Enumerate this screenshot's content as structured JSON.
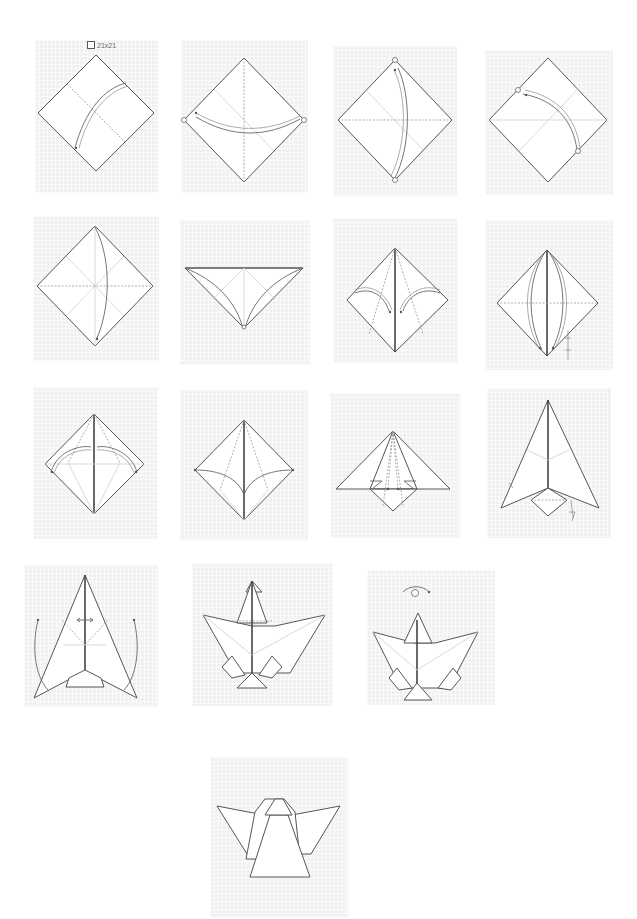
{
  "diagram": {
    "type": "origami-instructions",
    "paper_size_label": "21x21",
    "background": "#ffffff",
    "panel_background": "#f1f1f1",
    "line_color": "#555555",
    "steps": [
      {
        "step": 1,
        "row": 1,
        "description": "Square paper, diagonal valley crease, fold corner to corner",
        "symbols": [
          "paper-size",
          "valley-fold-arrow"
        ]
      },
      {
        "step": 2,
        "row": 1,
        "description": "Fold left corner to right corner along vertical diagonal",
        "symbols": [
          "valley-fold-arrow",
          "corner-markers"
        ]
      },
      {
        "step": 3,
        "row": 1,
        "description": "Fold top corner to bottom corner",
        "symbols": [
          "valley-fold-arrow",
          "corner-markers"
        ]
      },
      {
        "step": 4,
        "row": 1,
        "description": "Fold lower-right edge point to upper-left edge point",
        "symbols": [
          "valley-fold-arrow",
          "corner-markers"
        ]
      },
      {
        "step": 5,
        "row": 2,
        "description": "Fold top corner down to bottom corner",
        "symbols": [
          "valley-fold-arrow"
        ]
      },
      {
        "step": 6,
        "row": 2,
        "description": "Triangle with curved fold lines meeting at bottom point",
        "symbols": [
          "valley-fold-arrow"
        ]
      },
      {
        "step": 7,
        "row": 2,
        "description": "Fold side corners in to center line",
        "symbols": [
          "valley-fold-arrow"
        ]
      },
      {
        "step": 8,
        "row": 2,
        "description": "Fold edges to center, then unfold",
        "symbols": [
          "valley-fold-arrow",
          "fold-unfold"
        ]
      },
      {
        "step": 9,
        "row": 3,
        "description": "Fold both side corners in along arc",
        "symbols": [
          "valley-fold-arrow"
        ]
      },
      {
        "step": 10,
        "row": 3,
        "description": "Side corners brought to center crease",
        "symbols": [
          "valley-fold-arrow"
        ]
      },
      {
        "step": 11,
        "row": 3,
        "description": "Squash fold flaps at bottom",
        "symbols": [
          "squash-arrows"
        ]
      },
      {
        "step": 12,
        "row": 3,
        "description": "Kite shape with small diamond at base; repeat behind",
        "symbols": [
          "repeat-arrow"
        ]
      },
      {
        "step": 13,
        "row": 4,
        "description": "Swing outer wings up and out",
        "symbols": [
          "swing-arrows",
          "pleat-arrows"
        ]
      },
      {
        "step": 14,
        "row": 4,
        "description": "Wings spread, head formed at top",
        "symbols": [
          "pleat"
        ]
      },
      {
        "step": 15,
        "row": 4,
        "description": "Turn model over",
        "symbols": [
          "turn-over-symbol"
        ]
      },
      {
        "step": 16,
        "row": 5,
        "description": "Finished angel",
        "symbols": []
      }
    ]
  }
}
